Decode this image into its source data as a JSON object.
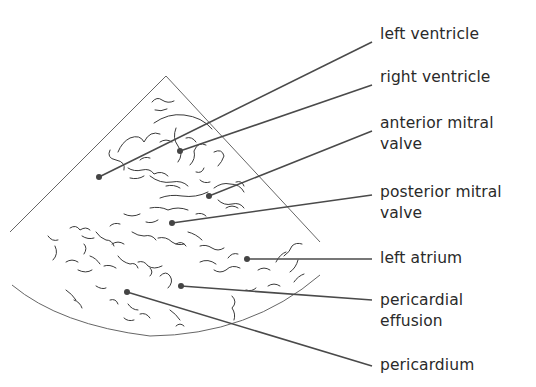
{
  "diagram": {
    "colors": {
      "line": "#555555",
      "leader": "#4a4a4a",
      "dot": "#444444",
      "text": "#2a2a2a",
      "speckle": "#3a3a3a"
    },
    "labels": [
      {
        "id": "left-ventricle",
        "lines": [
          "left ventricle"
        ],
        "text_y": 24,
        "line_end": [
          372,
          42
        ],
        "dot": [
          99,
          177
        ]
      },
      {
        "id": "right-ventricle",
        "lines": [
          "right ventricle"
        ],
        "text_y": 67,
        "line_end": [
          372,
          85
        ],
        "dot": [
          180,
          151
        ]
      },
      {
        "id": "anterior-mitral-valve",
        "lines": [
          "anterior mitral",
          "valve"
        ],
        "text_y": 113,
        "line_end": [
          372,
          131
        ],
        "dot": [
          209,
          196
        ]
      },
      {
        "id": "posterior-mitral-valve",
        "lines": [
          "posterior mitral",
          "valve"
        ],
        "text_y": 182,
        "line_end": [
          372,
          195
        ],
        "dot": [
          172,
          223
        ]
      },
      {
        "id": "left-atrium",
        "lines": [
          "left atrium"
        ],
        "text_y": 248,
        "line_end": [
          372,
          260
        ],
        "dot": [
          247,
          259
        ]
      },
      {
        "id": "pericardial-effusion",
        "lines": [
          "pericardial",
          "effusion"
        ],
        "text_y": 290,
        "line_end": [
          372,
          300
        ],
        "dot": [
          181,
          286
        ]
      },
      {
        "id": "pericardium",
        "lines": [
          "pericardium"
        ],
        "text_y": 355,
        "line_end": [
          372,
          366
        ],
        "dot": [
          127,
          292
        ]
      }
    ]
  }
}
